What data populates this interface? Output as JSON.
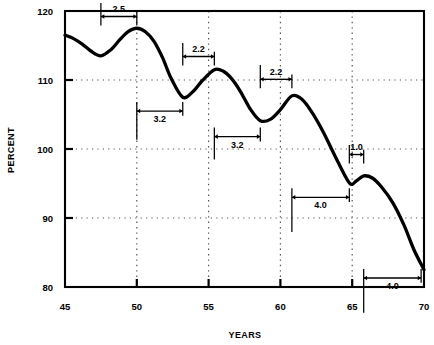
{
  "chart_data": {
    "type": "line",
    "title": "",
    "xlabel": "YEARS",
    "ylabel": "PERCENT",
    "xlim": [
      45,
      70
    ],
    "ylim": [
      80,
      120
    ],
    "xticks": [
      45,
      50,
      55,
      60,
      65,
      70
    ],
    "xtick_labels": [
      "45",
      "50",
      "55",
      "60",
      "65",
      "70"
    ],
    "yticks": [
      80,
      90,
      100,
      110,
      120
    ],
    "ytick_labels": [
      "80",
      "90",
      "100",
      "110",
      "120"
    ],
    "grid": "dotted horizontal and vertical gridlines at major ticks",
    "legend": "none",
    "series": [
      {
        "name": "percent",
        "x": [
          45.0,
          45.6,
          46.2,
          46.8,
          47.5,
          48.2,
          48.8,
          49.4,
          50.0,
          50.6,
          51.2,
          51.8,
          52.4,
          53.2,
          53.9,
          54.6,
          55.4,
          56.0,
          56.6,
          57.2,
          57.9,
          58.6,
          59.3,
          60.0,
          60.8,
          61.5,
          62.2,
          63.0,
          63.8,
          64.8,
          65.3,
          65.8,
          66.4,
          67.0,
          67.8,
          68.6,
          69.3,
          70.0
        ],
        "y": [
          116.5,
          116.0,
          115.2,
          114.2,
          113.5,
          114.4,
          115.8,
          117.0,
          117.5,
          117.0,
          115.6,
          113.2,
          110.2,
          107.5,
          108.3,
          110.0,
          111.5,
          111.3,
          110.2,
          108.4,
          105.8,
          104.1,
          104.3,
          105.7,
          107.7,
          107.2,
          105.3,
          102.4,
          99.0,
          95.1,
          95.4,
          96.1,
          95.8,
          94.6,
          92.3,
          89.0,
          85.4,
          82.5
        ]
      }
    ],
    "annotations": [
      {
        "id": "rise-1",
        "label": "2.5",
        "x_start": 47.5,
        "x_end": 50.0,
        "y_axis": 119.2,
        "label_side": "above",
        "tick_down_start": 5.6,
        "tick_down_end": 2.0
      },
      {
        "id": "fall-1",
        "label": "3.2",
        "x_start": 50.0,
        "x_end": 53.2,
        "y_axis": 105.5,
        "label_side": "below",
        "tick_up_start": 12.0,
        "tick_up_end": 2.0
      },
      {
        "id": "rise-2",
        "label": "2.2",
        "x_start": 53.2,
        "x_end": 55.4,
        "y_axis": 113.4,
        "label_side": "above",
        "tick_down_start": 5.6,
        "tick_down_end": 2.0
      },
      {
        "id": "fall-2",
        "label": "3.2",
        "x_start": 55.4,
        "x_end": 58.6,
        "y_axis": 101.8,
        "label_side": "below",
        "tick_up_start": 9.5,
        "tick_up_end": 2.0
      },
      {
        "id": "rise-3",
        "label": "2.2",
        "x_start": 58.6,
        "x_end": 60.8,
        "y_axis": 110.1,
        "label_side": "above",
        "tick_down_start": 6.0,
        "tick_down_end": 2.0
      },
      {
        "id": "fall-3",
        "label": "4.0",
        "x_start": 60.8,
        "x_end": 64.8,
        "y_axis": 93.0,
        "label_side": "below",
        "tick_up_start": 14.5,
        "tick_up_end": 2.0
      },
      {
        "id": "rise-4",
        "label": "1.0",
        "x_start": 64.8,
        "x_end": 65.8,
        "y_axis": 99.2,
        "label_side": "above",
        "tick_down_start": 4.0,
        "tick_down_end": 2.0
      },
      {
        "id": "fall-4",
        "label": "4.0",
        "x_start": 65.8,
        "x_end": 69.8,
        "y_axis": 81.3,
        "label_side": "below",
        "tick_up_start": 14.5,
        "tick_up_end": 2.0
      }
    ],
    "colors": {
      "line": "#000000",
      "axis": "#000000",
      "grid": "#555555",
      "background": "#ffffff",
      "annotation": "#000000"
    }
  }
}
